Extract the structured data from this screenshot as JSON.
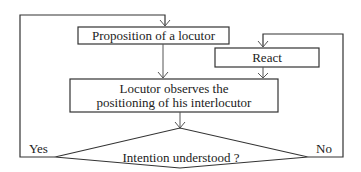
{
  "diagram": {
    "type": "flowchart",
    "nodes": {
      "proposition": {
        "label": "Proposition of a locutor"
      },
      "react": {
        "label": "React"
      },
      "observe": {
        "line1": "Locutor observes the",
        "line2": "positioning of his interlocutor"
      },
      "decision": {
        "label": "Intention understood ?"
      }
    },
    "edges": {
      "yes_label": "Yes",
      "no_label": "No"
    },
    "colors": {
      "stroke": "#333333",
      "background": "#ffffff",
      "text": "#222222"
    }
  }
}
